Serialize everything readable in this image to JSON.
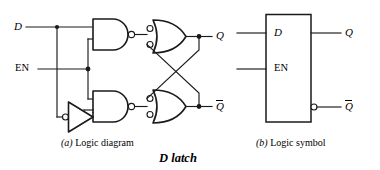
{
  "figure": {
    "title": "D latch",
    "background_color": "#ffffff",
    "line_color": "#1a1a1a"
  },
  "logic_diagram": {
    "caption_letter": "(a)",
    "caption_text": " Logic diagram",
    "inputs": [
      {
        "name": "d-input",
        "label": "D",
        "style": "italic"
      },
      {
        "name": "en-input",
        "label": "EN",
        "style": "upright"
      }
    ],
    "outputs": [
      {
        "name": "q-output",
        "label": "Q",
        "overbar": false
      },
      {
        "name": "q-not-output",
        "label": "Q",
        "overbar": true
      }
    ],
    "gates": [
      {
        "name": "nand-gate-top",
        "type": "nand",
        "shape": "and-shape",
        "inputs": 2,
        "output_bubble": true
      },
      {
        "name": "nand-gate-bottom",
        "type": "nand",
        "shape": "and-shape",
        "inputs": 2,
        "output_bubble": true
      },
      {
        "name": "nand-gate-q",
        "type": "nand",
        "shape": "or-shape-bubbled-inputs",
        "inputs": 2,
        "output_bubble": false
      },
      {
        "name": "nand-gate-qnot",
        "type": "nand",
        "shape": "or-shape-bubbled-inputs",
        "inputs": 2,
        "output_bubble": false
      },
      {
        "name": "inverter-gate",
        "type": "inverter",
        "shape": "triangle",
        "inputs": 1,
        "input_bubble": true
      }
    ],
    "junction_count": 5,
    "cross_coupled": true
  },
  "logic_symbol": {
    "caption_letter": "(b)",
    "caption_text": " Logic symbol",
    "box": {
      "name": "latch-box"
    },
    "inputs": [
      {
        "name": "d-input",
        "label": "D",
        "style": "italic"
      },
      {
        "name": "en-input",
        "label": "EN",
        "style": "upright"
      }
    ],
    "outputs": [
      {
        "name": "q-output",
        "label": "Q",
        "overbar": false,
        "bubble": false
      },
      {
        "name": "q-not-output",
        "label": "Q",
        "overbar": true,
        "bubble": true
      }
    ]
  }
}
